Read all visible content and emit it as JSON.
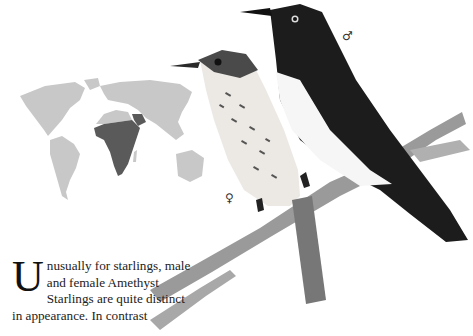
{
  "page": {
    "species": "Amethyst Starling",
    "map": {
      "highlighted_region": "Sub-Saharan Africa",
      "land_color": "#c8c8c8",
      "range_color": "#5a5a5a"
    },
    "illustration": {
      "birds": [
        {
          "sex": "male",
          "symbol": "♂"
        },
        {
          "sex": "female",
          "symbol": "♀"
        }
      ]
    },
    "text": {
      "drop_cap": "U",
      "body": "nusually for starlings, male and female Amethyst Starlings are quite distinct in appearance. In contrast"
    }
  }
}
